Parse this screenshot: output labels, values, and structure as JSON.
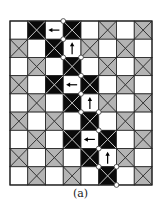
{
  "caption": "(a)",
  "grid": {
    "cols": 8,
    "rows": 9,
    "origin": [
      10,
      21
    ],
    "cell_w": 17.75,
    "cell_h": 18.22,
    "colors": {
      "white": "#ffffff",
      "gray": "#b4b4b4",
      "black": "#0a0a0a",
      "gray_x_line": "#333333",
      "black_x_line": "#c8c8c8",
      "grid_line": "#222222",
      "dot_fill": "#ffffff",
      "dot_stroke": "#333333",
      "arrow": "#000000"
    },
    "cells": [
      [
        "W",
        "B",
        "W",
        "B",
        "W",
        "G",
        "W",
        "G"
      ],
      [
        "G",
        "W",
        "B",
        "W",
        "G",
        "W",
        "G",
        "W"
      ],
      [
        "W",
        "G",
        "W",
        "B",
        "W",
        "G",
        "W",
        "G"
      ],
      [
        "G",
        "W",
        "B",
        "W",
        "B",
        "W",
        "G",
        "W"
      ],
      [
        "W",
        "G",
        "W",
        "B",
        "W",
        "G",
        "W",
        "G"
      ],
      [
        "G",
        "W",
        "G",
        "W",
        "B",
        "W",
        "G",
        "W"
      ],
      [
        "W",
        "G",
        "W",
        "B",
        "W",
        "B",
        "W",
        "G"
      ],
      [
        "G",
        "W",
        "G",
        "W",
        "B",
        "W",
        "G",
        "W"
      ],
      [
        "W",
        "G",
        "W",
        "G",
        "W",
        "B",
        "W",
        "G"
      ]
    ],
    "arrows": [
      {
        "row": 0,
        "col": 2,
        "dir": "left"
      },
      {
        "row": 1,
        "col": 3,
        "dir": "up"
      },
      {
        "row": 3,
        "col": 3,
        "dir": "left"
      },
      {
        "row": 4,
        "col": 4,
        "dir": "up"
      },
      {
        "row": 6,
        "col": 4,
        "dir": "left"
      },
      {
        "row": 7,
        "col": 5,
        "dir": "up"
      }
    ],
    "path_vertices": [
      [
        3,
        0
      ],
      [
        3,
        1
      ],
      [
        3,
        2
      ],
      [
        4,
        2
      ],
      [
        4,
        3
      ],
      [
        4,
        4
      ],
      [
        4,
        5
      ],
      [
        5,
        5
      ],
      [
        5,
        6
      ],
      [
        5,
        7
      ],
      [
        5,
        8
      ],
      [
        6,
        8
      ],
      [
        6,
        9
      ]
    ]
  }
}
